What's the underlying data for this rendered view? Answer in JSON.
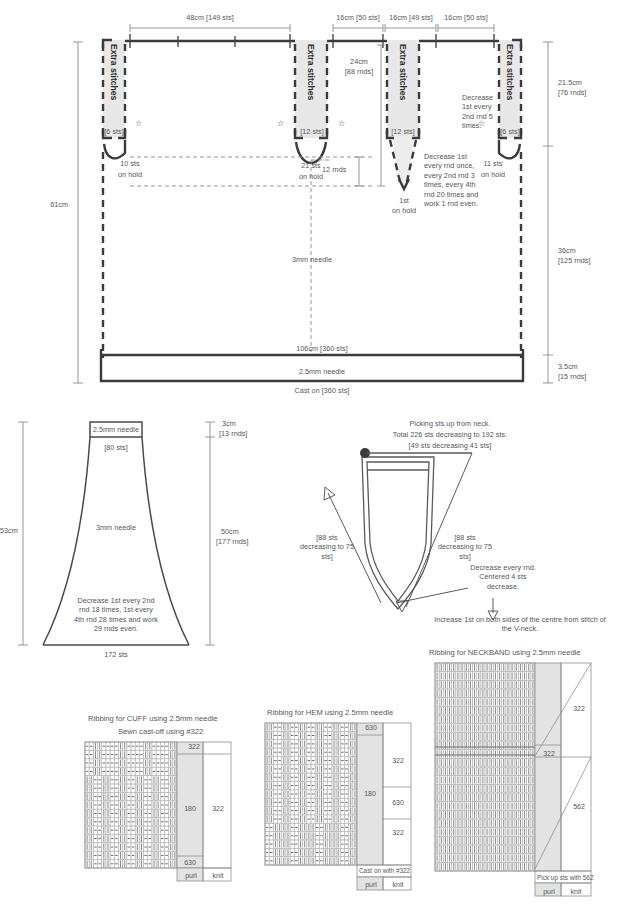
{
  "meta": {
    "doc_type": "knitting-pattern-schematic"
  },
  "body_schematic": {
    "name": "body-schematic",
    "top_dims": [
      {
        "label": "48cm [149 sts]"
      },
      {
        "label": "16cm [50 sts]"
      },
      {
        "label": "16cm [49 sts]"
      },
      {
        "label": "16cm [50 sts]"
      }
    ],
    "left_dim": "61cm",
    "right_dims": [
      {
        "label_line1": "21.5cm",
        "label_line2": "[76 rnds]"
      },
      {
        "label_line1": "36cm",
        "label_line2": "[125 rnds]"
      },
      {
        "label_line1": "3.5cm",
        "label_line2": "[15 rnds]"
      }
    ],
    "extra_stitches_label": "Extra stitches",
    "shoulder_panels": [
      {
        "sts": "[6 sts]",
        "hold_line1": "10 sts",
        "hold_line2": "on hold"
      },
      {
        "sts": "[12 sts]",
        "hold_line1": "21 sts",
        "hold_line2": "on hold"
      },
      {
        "sts": "[12 sts]",
        "hold_line1": "1st",
        "hold_line2": "on hold"
      },
      {
        "sts": "[6 sts]",
        "hold_line1": "11 sts",
        "hold_line2": "on hold"
      }
    ],
    "armhole_depth_line1": "24cm",
    "armhole_depth_line2": "[88 rnds]",
    "rnds_12": "12 rnds",
    "decrease_note_right": "Decrease\n1st every\n2nd rnd 5\ntimes.",
    "decrease_note_vneck": "Decrease 1st\nevery rnd once,\nevery 2nd rnd 3\ntimes, every 4th\nrnd 20 times and\nwork 1 rnd even.",
    "needle_3mm": "3mm needle",
    "bottom_width": "106cm [360 sts]",
    "needle_25mm": "2.5mm needle",
    "cast_on": "Cast on [360 sts]"
  },
  "sleeve_schematic": {
    "name": "sleeve-schematic",
    "cuff_needle": "2.5mm needle",
    "cuff_sts": "[80 sts]",
    "body_needle": "3mm needle",
    "left_dim": "53cm",
    "right_dims": [
      {
        "line1": "3cm",
        "line2": "[13 rnds]"
      },
      {
        "line1": "50cm",
        "line2": "[177 rnds]"
      }
    ],
    "decrease_note": "Decrease 1st every\n2nd rnd 18 times,\n1st every 4th rnd\n28 times and work\n29 rnds even.",
    "bottom_sts": "172 sts"
  },
  "neck_schematic": {
    "name": "vneck-schematic",
    "title_line1": "Picking sts up from neck.",
    "title_line2": "Total 226 sts decreasing to 192 sts.",
    "title_line3": "[49 sts decreasing 41 sts]",
    "left_note": "[88 sts\ndecreasing\nto 75 sts]",
    "right_note": "[88 sts\ndecreasing\nto 75 sts]",
    "decrease_note": "Decrease every\nrnd. Centered 4\nsts decrease.",
    "increase_note": "Increase 1st on both sides of the centre\nfrom stitch of the V-neck."
  },
  "cuff_chart": {
    "name": "cuff-ribbing-chart",
    "title_line1": "Ribbing for CUFF using 2.5mm needle",
    "title_line2": "Sewn cast-off using #322",
    "labels": {
      "top": "322",
      "mid_left": "180",
      "mid_right": "322",
      "bottom_left": "630"
    },
    "legend": {
      "purl": "purl",
      "knit": "knit"
    },
    "grid": {
      "cols": 22,
      "rows": 15,
      "purl_rows_top": 4
    }
  },
  "hem_chart": {
    "name": "hem-ribbing-chart",
    "title_line1": "Ribbing for HEM using 2.5mm needle",
    "labels": {
      "top_left": "630",
      "right_upper": "322",
      "mid_left": "180",
      "right_mid": "630",
      "right_lower": "322",
      "cast_on": "Cast on with #322"
    },
    "legend": {
      "purl": "purl",
      "knit": "knit"
    },
    "grid": {
      "cols": 22,
      "rows": 17
    }
  },
  "neckband_chart": {
    "name": "neckband-ribbing-chart",
    "title": "Ribbing for NECKBAND using 2.5mm needle",
    "labels": {
      "upper_right": "322",
      "mid_left": "322",
      "lower_right": "562",
      "pick_up": "Pick up sts with 562"
    },
    "legend": {
      "purl": "purl",
      "knit": "knit"
    },
    "grid": {
      "cols": 24,
      "rows": 24
    }
  },
  "glyphs": {
    "star": "☆"
  }
}
